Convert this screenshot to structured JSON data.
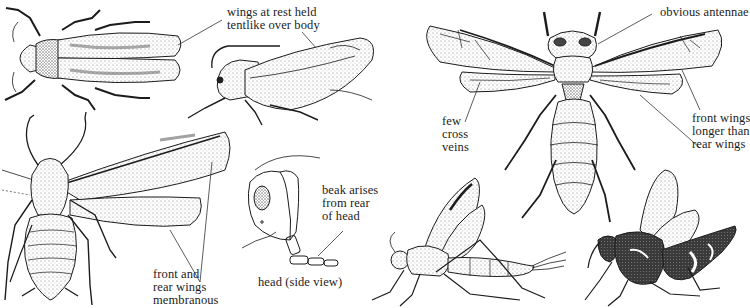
{
  "figure": {
    "left_group": "true bugs / homopterans",
    "right_group": "wasps / hymenopterans"
  },
  "labels": {
    "wings_at_rest": "wings at rest held\ntentlike over body",
    "front_rear_membranous": "front and\nrear wings\nmembranous",
    "beak_arises": "beak arises\nfrom rear\nof head",
    "head_side_view": "head (side view)",
    "obvious_antennae": "obvious antennae",
    "few_cross_veins": "few\ncross\nveins",
    "front_wings_longer": "front wings\nlonger than\nrear wings"
  },
  "illustrations": [
    {
      "id": "leafhopper-dorsal",
      "desc": "leafhopper, top view"
    },
    {
      "id": "leafhopper-side",
      "desc": "leafhopper, side view"
    },
    {
      "id": "aphid-winged",
      "desc": "winged aphid, top view"
    },
    {
      "id": "bug-head-side",
      "desc": "head in side view showing beak"
    },
    {
      "id": "wasp-dorsal",
      "desc": "wasp, top view with spread wings"
    },
    {
      "id": "ichneumon-side",
      "desc": "ichneumon wasp, side view"
    },
    {
      "id": "wasp-side-dark",
      "desc": "banded wasp, side view"
    }
  ],
  "colors": {
    "ink": "#1c1c1c",
    "stipple": "#6e6e6e",
    "background": "#ffffff"
  }
}
